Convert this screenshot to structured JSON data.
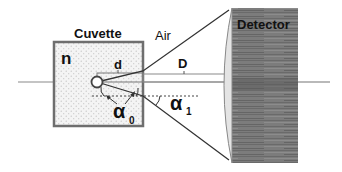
{
  "diagram": {
    "labels": {
      "cuvette": "Cuvette",
      "medium_index": "n",
      "air": "Air",
      "detector": "Detector",
      "small_distance": "d",
      "large_distance": "D",
      "angle_inside": "α",
      "angle_inside_sub": "0",
      "angle_outside": "α",
      "angle_outside_sub": "1"
    },
    "colors": {
      "cuvette_border": "#6e6e6e",
      "cuvette_fill": "#f2f2f2",
      "detector_fill": "#7a7a7a",
      "detector_dark": "#555555",
      "lens_fill": "#e6e6e6",
      "line": "#333333",
      "axis": "#8a8a8a"
    }
  }
}
